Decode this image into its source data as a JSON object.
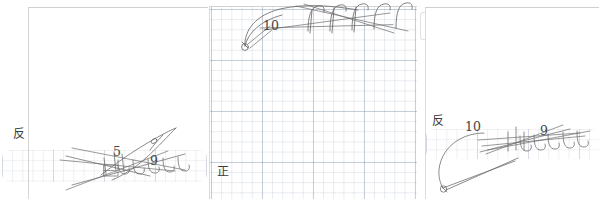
{
  "document": {
    "type": "scanned-handwritten-worksheet",
    "panel_count": 3
  },
  "panels": [
    {
      "id": "left",
      "side_label": "反",
      "annotations": [
        {
          "text": "5",
          "x": 113,
          "y": 146
        },
        {
          "text": "9",
          "x": 150,
          "y": 155
        }
      ]
    },
    {
      "id": "middle",
      "side_label": "正",
      "annotations": [
        {
          "text": "10",
          "x": 55,
          "y": 20
        }
      ]
    },
    {
      "id": "right",
      "side_label": "反",
      "annotations": [
        {
          "text": "10",
          "x": 45,
          "y": 121
        },
        {
          "text": "9",
          "x": 120,
          "y": 125
        }
      ]
    }
  ],
  "colors": {
    "page": "#ffffff",
    "ink": "#555555",
    "grid_minor": "#b9c3d2",
    "grid_major": "#a6b2c6",
    "label_text": "#3c3c3c"
  }
}
